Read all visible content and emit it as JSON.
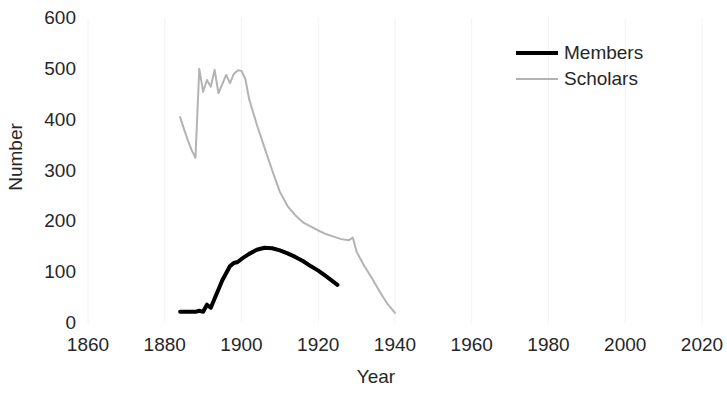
{
  "chart_data": {
    "type": "line",
    "title": "",
    "xlabel": "Year",
    "ylabel": "Number",
    "xlim": [
      1860,
      2020
    ],
    "ylim": [
      0,
      600
    ],
    "xticks": [
      1860,
      1880,
      1900,
      1920,
      1940,
      1960,
      1980,
      2000,
      2020
    ],
    "ytricks_note": "",
    "yticks": [
      0,
      100,
      200,
      300,
      400,
      500,
      600
    ],
    "grid": false,
    "legend_position": "top-right",
    "series": [
      {
        "name": "Members",
        "color": "#000000",
        "width": 4,
        "x": [
          1884,
          1886,
          1888,
          1889,
          1890,
          1891,
          1892,
          1893,
          1894,
          1895,
          1896,
          1897,
          1898,
          1899,
          1900,
          1902,
          1904,
          1906,
          1908,
          1910,
          1912,
          1914,
          1916,
          1918,
          1920,
          1922,
          1925
        ],
        "y": [
          22,
          22,
          22,
          24,
          22,
          36,
          30,
          48,
          66,
          84,
          98,
          112,
          118,
          120,
          126,
          136,
          144,
          148,
          147,
          143,
          137,
          130,
          122,
          112,
          103,
          92,
          75
        ]
      },
      {
        "name": "Scholars",
        "color": "#b3b3b3",
        "width": 2,
        "x": [
          1884,
          1885,
          1886,
          1887,
          1888,
          1889,
          1890,
          1891,
          1892,
          1893,
          1894,
          1895,
          1896,
          1897,
          1898,
          1899,
          1900,
          1901,
          1902,
          1904,
          1906,
          1908,
          1910,
          1912,
          1914,
          1916,
          1918,
          1920,
          1922,
          1924,
          1926,
          1928,
          1929,
          1930,
          1932,
          1934,
          1936,
          1938,
          1940
        ],
        "y": [
          405,
          382,
          360,
          340,
          325,
          500,
          455,
          478,
          465,
          498,
          452,
          470,
          488,
          472,
          490,
          497,
          496,
          480,
          440,
          390,
          345,
          300,
          258,
          230,
          212,
          198,
          190,
          182,
          175,
          170,
          165,
          163,
          168,
          140,
          112,
          88,
          62,
          38,
          20
        ]
      }
    ]
  },
  "axes": {
    "yticks": [
      "600",
      "500",
      "400",
      "300",
      "200",
      "100",
      "0"
    ],
    "xticks": [
      "1860",
      "1880",
      "1900",
      "1920",
      "1940",
      "1960",
      "1980",
      "2000",
      "2020"
    ],
    "ylabel": "Number",
    "xlabel": "Year"
  },
  "legend": {
    "entries": [
      {
        "label": "Members",
        "color": "#000000"
      },
      {
        "label": "Scholars",
        "color": "#b3b3b3"
      }
    ]
  }
}
